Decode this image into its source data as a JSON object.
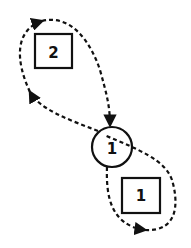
{
  "diagram": {
    "type": "state-transition loops",
    "nodes": [
      {
        "id": "circle-1",
        "shape": "circle",
        "label": "1"
      },
      {
        "id": "box-2",
        "shape": "square",
        "label": "2"
      },
      {
        "id": "box-1",
        "shape": "square",
        "label": "1"
      }
    ],
    "edges": [
      {
        "from": "circle-1",
        "to": "circle-1",
        "via": "box-2",
        "style": "dashed",
        "direction": "counter-clockwise loop through upper-left"
      },
      {
        "from": "circle-1",
        "to": "circle-1",
        "via": "box-1",
        "style": "dashed",
        "direction": "clockwise loop through lower-right"
      }
    ],
    "colors": {
      "stroke": "#111111",
      "background": "#ffffff"
    }
  }
}
